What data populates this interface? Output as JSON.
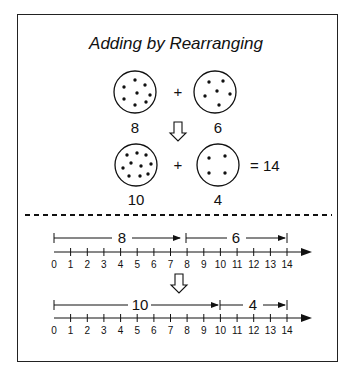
{
  "title": "Adding by Rearranging",
  "top_section": {
    "row1": {
      "left_count": "8",
      "operator": "+",
      "right_count": "6"
    },
    "row2": {
      "left_count": "10",
      "operator": "+",
      "right_count": "4",
      "result": "= 14"
    }
  },
  "number_lines": [
    {
      "first_label": "8",
      "second_label": "6",
      "ticks": [
        "0",
        "1",
        "2",
        "3",
        "4",
        "5",
        "6",
        "7",
        "8",
        "9",
        "10",
        "11",
        "12",
        "13",
        "14"
      ]
    },
    {
      "first_label": "10",
      "second_label": "4",
      "ticks": [
        "0",
        "1",
        "2",
        "3",
        "4",
        "5",
        "6",
        "7",
        "8",
        "9",
        "10",
        "11",
        "12",
        "13",
        "14"
      ]
    }
  ],
  "colors": {
    "ink": "#111111",
    "background": "#ffffff"
  }
}
